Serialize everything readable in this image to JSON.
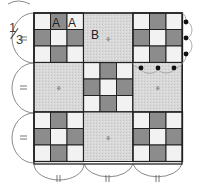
{
  "diagram": {
    "title": "",
    "fraction": {
      "numerator": "1",
      "denominator": "3"
    },
    "block_labels": {
      "a1": "A",
      "a2": "A",
      "b": "B"
    },
    "grid": {
      "rows": 3,
      "cols": 3,
      "block_size_px": 49.5,
      "origin": [
        34,
        13
      ]
    },
    "layout": [
      [
        "nine-patch",
        "plain",
        "nine-patch"
      ],
      [
        "plain",
        "nine-patch",
        "plain"
      ],
      [
        "nine-patch",
        "plain",
        "nine-patch"
      ]
    ],
    "nine_patch_pattern": [
      [
        "light",
        "dark",
        "light"
      ],
      [
        "dark",
        "light",
        "dark"
      ],
      [
        "light",
        "dark",
        "light"
      ]
    ],
    "colors": {
      "light": "#f2f2f2",
      "dark": "#8c8c8c",
      "plain": "#d6d6d6",
      "line": "#222222",
      "arc": "#888888",
      "dot": "#111111"
    },
    "markers": {
      "left_equal_marks": 3,
      "bottom_double_ticks": 3,
      "right_edge_dots": 3,
      "scallop_dots": 5
    }
  }
}
